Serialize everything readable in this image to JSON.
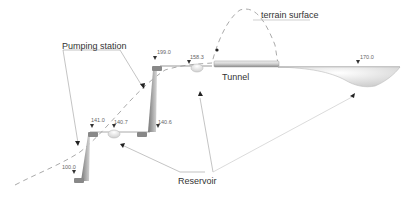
{
  "labels": {
    "pumping_station": "Pumping station",
    "terrain_surface": "terrain surface",
    "tunnel": "Tunnel",
    "reservoir": "Reservoir"
  },
  "elevations": [
    {
      "id": "e199",
      "value": "199.0"
    },
    {
      "id": "e158",
      "value": "158.3"
    },
    {
      "id": "e141",
      "value": "141.0"
    },
    {
      "id": "e1407",
      "value": "140.7"
    },
    {
      "id": "e1406",
      "value": "140.6"
    },
    {
      "id": "e100",
      "value": "100.0"
    },
    {
      "id": "e170",
      "value": "170.0"
    }
  ],
  "colors": {
    "line": "#999999",
    "dashed": "#aaaaaa",
    "fill_dark": "#888888",
    "fill_light": "#dddddd",
    "text": "#333333"
  }
}
